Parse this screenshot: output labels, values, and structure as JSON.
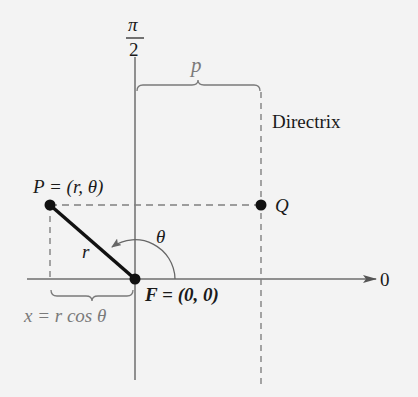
{
  "diagram": {
    "type": "polar coordinate diagram of conic with focus and directrix",
    "colors": {
      "background": "#f3f3f3",
      "axis": "#6e6e6e",
      "dashed": "#808080",
      "segment": "#111111",
      "text": "#1a1a1a",
      "secondary_text": "#7a7a7a"
    },
    "labels": {
      "pi": "π",
      "two": "2",
      "p": "p",
      "directrix": "Directrix",
      "point_p": "P = (r, θ)",
      "point_q": "Q",
      "r": "r",
      "theta": "θ",
      "focus": "F = (0, 0)",
      "polar_axis_zero": "0",
      "x_relation": "x = r cos θ"
    },
    "points": {
      "P": {
        "x": 50,
        "y": 205
      },
      "Q": {
        "x": 261,
        "y": 205
      },
      "F": {
        "x": 135,
        "y": 279
      }
    }
  }
}
